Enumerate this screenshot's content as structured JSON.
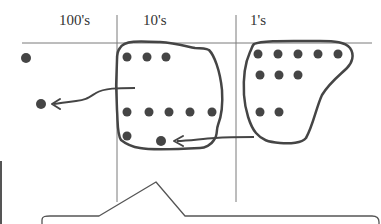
{
  "diagram": {
    "type": "place-value-chart",
    "columns": [
      {
        "label": "100's",
        "x": 77
      },
      {
        "label": "10's",
        "x": 162
      },
      {
        "label": "1's",
        "x": 258
      }
    ],
    "colors": {
      "line": "#808080",
      "stroke": "#444444",
      "dot": "#454545"
    },
    "groups": {
      "hundreds_dots": 2,
      "tens_dots": 10,
      "ones_dots": 10
    }
  }
}
